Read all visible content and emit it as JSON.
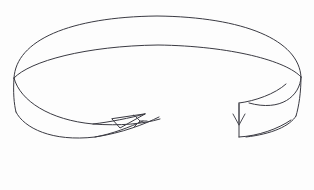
{
  "figure": {
    "title": "Mobius band with orientation arrows",
    "kind": "line-diagram",
    "background_color": "#fdfdfd",
    "stroke_color": "#3a3a42",
    "stroke_width": 1,
    "width": 314,
    "height": 190
  },
  "parts": {
    "top_outer_rim_label": "outer top rim arc",
    "top_inner_rim_label": "inner top rim arc",
    "left_edge_label": "left band edge",
    "right_edge_label": "right band edge",
    "bottom_front_label": "front lower band edge",
    "twist_label": "half twist crossing",
    "cut_face_label": "cut face",
    "left_arrow_label": "left orientation arrowhead",
    "right_arrow_label": "right orientation arrowhead"
  },
  "geometry": {
    "outer_top_arc": "M 14 78 C 16 40 70 17 157 16 C 244 17 299 40 301 77",
    "inner_top_arc": "M 14 78 C 30 61 86 46 158 45 C 231 46 287 61 301 77",
    "left_edge": "M 14 78 C 13 92 14 104 16 112",
    "right_edge": "M 301 77 C 301 92 299 106 296 116",
    "outer_lower_arc": "M 16 112 C 24 128 52 142 95 137 C 122 133 145 124 159 117",
    "inner_lower_arc": "M 14 78 C 20 101 50 120 93 124 C 120 126 143 124 160 119",
    "right_lower_outer": "M 296 116 C 290 126 272 134 246 137",
    "right_lower_inner": "M 301 77 C 300 96 281 112 249 103",
    "cut_face_vertical": "M 239 103 L 239 137",
    "cut_face_top": "M 239 103 C 255 101 275 94 286 84",
    "cut_face_bottom": "M 239 137 C 258 136 278 129 291 120",
    "twist_upper": "M 93 124 C 110 122 130 118 145 114",
    "twist_lower": "M 95 137 C 112 134 130 127 143 121",
    "arrow_tip_path": "M 145 114 L 120 128 L 112 119 Z",
    "left_arrow_head": "M 134 115 L 140 121 L 134 127",
    "left_arrow_stem": "M 140 121 L 147 121",
    "right_arrow_stem": "M 239 104 L 239 125",
    "right_arrow_head": "M 233 114 L 239 125 L 245 114"
  }
}
